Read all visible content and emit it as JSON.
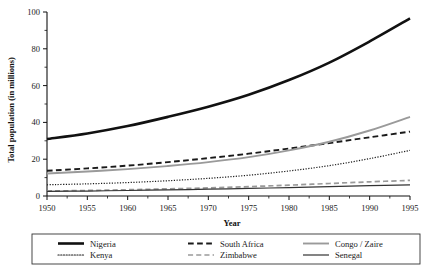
{
  "chart_data": {
    "type": "line",
    "title": "",
    "xlabel": "Year",
    "ylabel": "Total population (in millions)",
    "xlim": [
      1950,
      1995
    ],
    "ylim": [
      0,
      100
    ],
    "xticks": [
      1950,
      1955,
      1960,
      1965,
      1970,
      1975,
      1980,
      1985,
      1990,
      1995
    ],
    "yticks": [
      0,
      20,
      40,
      60,
      80,
      100
    ],
    "yticks_minor": [
      10,
      30,
      50,
      70,
      90
    ],
    "grid": false,
    "legend_position": "bottom",
    "legend_columns": 3,
    "x": [
      1950,
      1955,
      1960,
      1965,
      1970,
      1975,
      1980,
      1985,
      1990,
      1995
    ],
    "series": [
      {
        "name": "Nigeria",
        "style": "solid",
        "color": "#111111",
        "width": 2.6,
        "values": [
          31.0,
          34.0,
          38.0,
          43.0,
          48.5,
          55.0,
          63.0,
          72.5,
          84.0,
          96.5
        ]
      },
      {
        "name": "Kenya",
        "style": "dotted",
        "color": "#1a1a1a",
        "width": 1.2,
        "values": [
          6.1,
          6.6,
          7.3,
          8.3,
          9.6,
          11.3,
          13.6,
          16.5,
          20.3,
          24.8
        ]
      },
      {
        "name": "South Africa",
        "style": "dashed",
        "color": "#1a1a1a",
        "width": 1.9,
        "values": [
          13.7,
          15.0,
          16.5,
          18.4,
          20.6,
          23.0,
          25.8,
          28.8,
          31.9,
          35.0
        ]
      },
      {
        "name": "Zimbabwe",
        "style": "dashed",
        "color": "#9a9a9a",
        "width": 1.7,
        "values": [
          2.7,
          3.0,
          3.4,
          3.9,
          4.4,
          5.1,
          5.9,
          6.8,
          7.7,
          8.5
        ]
      },
      {
        "name": "Congo / Zaire",
        "style": "solid",
        "color": "#9a9a9a",
        "width": 1.9,
        "values": [
          12.2,
          13.3,
          14.6,
          16.3,
          18.4,
          21.1,
          24.8,
          29.5,
          35.6,
          43.0
        ]
      },
      {
        "name": "Senegal",
        "style": "solid",
        "color": "#333333",
        "width": 1.2,
        "values": [
          2.5,
          2.7,
          3.0,
          3.3,
          3.7,
          4.1,
          4.6,
          5.1,
          5.6,
          6.1
        ]
      }
    ]
  },
  "legend": {
    "entries": [
      {
        "label": "Nigeria",
        "col": 0,
        "row": 0
      },
      {
        "label": "Kenya",
        "col": 0,
        "row": 1
      },
      {
        "label": "South Africa",
        "col": 1,
        "row": 0
      },
      {
        "label": "Zimbabwe",
        "col": 1,
        "row": 1
      },
      {
        "label": "Congo / Zaire",
        "col": 2,
        "row": 0
      },
      {
        "label": "Senegal",
        "col": 2,
        "row": 1
      }
    ]
  }
}
